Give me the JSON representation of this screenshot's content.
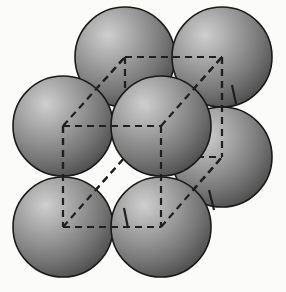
{
  "figure": {
    "title": "Close-packed spheres with dashed cubic unit cell",
    "background_color": "#fbfbfa",
    "canvas": {
      "width": 286,
      "height": 292
    }
  },
  "style": {
    "sphere_outline_color": "#1a1a1a",
    "sphere_outline_width": 1.6,
    "sphere_highlight_color": "#c9c9c9",
    "sphere_mid_color": "#8e8e8e",
    "sphere_shadow_color": "#4a4a4a",
    "sphere_radius": 50,
    "dash_color": "#1f1f1f",
    "dash_width": 2.2,
    "dash_pattern": "7,5"
  },
  "spheres": [
    {
      "id": "sphere-back-top-left",
      "label": "back top left",
      "cx": 125,
      "cy": 57,
      "r": 50,
      "layer": "back",
      "z": 1
    },
    {
      "id": "sphere-back-top-right",
      "label": "back top right",
      "cx": 222,
      "cy": 57,
      "r": 50,
      "layer": "back",
      "z": 2
    },
    {
      "id": "sphere-back-right-mid",
      "label": "back right middle",
      "cx": 222,
      "cy": 157,
      "r": 50,
      "layer": "back",
      "z": 3
    },
    {
      "id": "sphere-mid-left",
      "label": "middle left",
      "cx": 63,
      "cy": 126,
      "r": 50,
      "layer": "middle",
      "z": 4
    },
    {
      "id": "sphere-bottom-right",
      "label": "bottom right",
      "cx": 222,
      "cy": 157,
      "r": 50,
      "layer": "front",
      "z": 5
    },
    {
      "id": "sphere-front-bottom-left",
      "label": "front bottom left",
      "cx": 63,
      "cy": 227,
      "r": 50,
      "layer": "front",
      "z": 6
    },
    {
      "id": "sphere-front-bottom-mid",
      "label": "front bottom mid",
      "cx": 161,
      "cy": 227,
      "r": 50,
      "layer": "front",
      "z": 7
    },
    {
      "id": "sphere-center",
      "label": "centre",
      "cx": 161,
      "cy": 126,
      "r": 50,
      "layer": "middle",
      "z": 8
    }
  ],
  "unit_cell": {
    "name": "dashed cubic unit cell",
    "front_face": [
      {
        "name": "front-top-left",
        "x": 63,
        "y": 126
      },
      {
        "name": "front-top-right",
        "x": 161,
        "y": 126
      },
      {
        "name": "front-bottom-right",
        "x": 161,
        "y": 227
      },
      {
        "name": "front-bottom-left",
        "x": 63,
        "y": 227
      }
    ],
    "back_face": [
      {
        "name": "back-top-left",
        "x": 125,
        "y": 57
      },
      {
        "name": "back-top-right",
        "x": 222,
        "y": 57
      },
      {
        "name": "back-bottom-right",
        "x": 222,
        "y": 157
      },
      {
        "name": "back-bottom-left",
        "x": 125,
        "y": 157
      }
    ],
    "connector_edges": [
      {
        "name": "edge-top-left",
        "from": [
          63,
          126
        ],
        "to": [
          125,
          57
        ]
      },
      {
        "name": "edge-top-right",
        "from": [
          161,
          126
        ],
        "to": [
          222,
          57
        ]
      },
      {
        "name": "edge-bottom-right",
        "from": [
          161,
          227
        ],
        "to": [
          222,
          157
        ]
      },
      {
        "name": "edge-bottom-left",
        "from": [
          63,
          227
        ],
        "to": [
          125,
          157
        ]
      }
    ],
    "visible_tick_marks": [
      {
        "name": "tick-upper-right",
        "x1": 232,
        "y1": 85,
        "x2": 236,
        "y2": 104
      },
      {
        "name": "tick-lower-right",
        "x1": 209,
        "y1": 190,
        "x2": 214,
        "y2": 210
      },
      {
        "name": "tick-lower-mid",
        "x1": 124,
        "y1": 208,
        "x2": 128,
        "y2": 228
      }
    ]
  }
}
